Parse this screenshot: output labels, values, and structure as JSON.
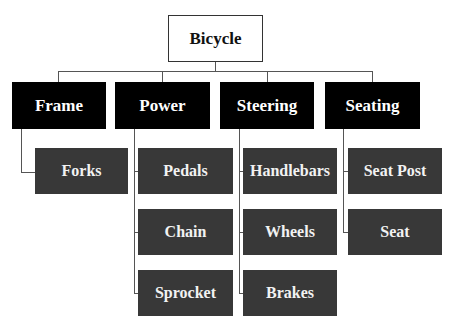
{
  "diagram": {
    "title": "Bicycle",
    "categories": [
      {
        "label": "Frame",
        "children": [
          "Forks"
        ]
      },
      {
        "label": "Power",
        "children": [
          "Pedals",
          "Chain",
          "Sprocket"
        ]
      },
      {
        "label": "Steering",
        "children": [
          "Handlebars",
          "Wheels",
          "Brakes"
        ]
      },
      {
        "label": "Seating",
        "children": [
          "Seat Post",
          "Seat"
        ]
      }
    ]
  },
  "colors": {
    "category_bg": "#000000",
    "leaf_bg": "#383838",
    "root_bg": "#ffffff",
    "connector": "#555555"
  }
}
